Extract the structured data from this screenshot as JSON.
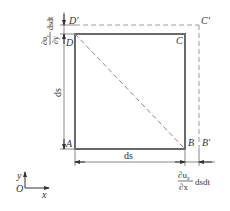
{
  "diagram": {
    "type": "deformation-of-element",
    "colors": {
      "solid": "#6a6a6a",
      "dashed": "#9a9a9a",
      "text": "#333333",
      "background": "#ffffff"
    },
    "points": {
      "A": "A",
      "B": "B",
      "C": "C",
      "D": "D",
      "B_prime": "B'",
      "C_prime": "C'",
      "D_prime": "D'"
    },
    "dimensions": {
      "bottom_side": "ds",
      "left_side": "ds",
      "x_elongation_num": "∂u",
      "x_elongation_num_sub": "x",
      "x_elongation_den": "∂x",
      "x_elongation_tail": "dsdt",
      "y_elongation_num": "∂u",
      "y_elongation_num_sub": "y",
      "y_elongation_den": "∂y",
      "y_elongation_tail": "dsdt"
    },
    "axes": {
      "origin": "O",
      "x": "x",
      "y": "y"
    }
  }
}
